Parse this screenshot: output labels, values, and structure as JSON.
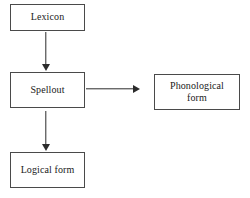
{
  "diagram": {
    "background_color": "#ffffff",
    "border_color": "#4a4a4a",
    "text_color": "#1a1a1a",
    "arrow_color": "#2b2b2b",
    "nodes": [
      {
        "id": "lexicon",
        "label": "Lexicon"
      },
      {
        "id": "spellout",
        "label": "Spellout"
      },
      {
        "id": "phonological_form",
        "label_line1": "Phonological",
        "label_line2": "form"
      },
      {
        "id": "logical_form",
        "label": "Logical form"
      }
    ],
    "edges": [
      {
        "id": "lexicon-to-spellout",
        "from": "Lexicon",
        "to": "Spellout",
        "direction": "down"
      },
      {
        "id": "spellout-to-phonological",
        "from": "Spellout",
        "to": "Phonological form",
        "direction": "right"
      },
      {
        "id": "spellout-to-logical",
        "from": "Spellout",
        "to": "Logical form",
        "direction": "down"
      }
    ]
  }
}
